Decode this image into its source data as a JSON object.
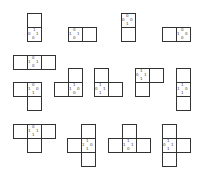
{
  "diagram": {
    "title": "",
    "cell_size": 14,
    "line_color": "#333333",
    "shapes": [
      {
        "id": "s1",
        "cells": [
          [
            27,
            13
          ],
          [
            27,
            27
          ]
        ],
        "marked": [
          27,
          27
        ],
        "marks": [
          {
            "t": "1",
            "dx": 6,
            "dy": 1
          },
          {
            "t": "0",
            "dx": 1,
            "dy": 5
          },
          {
            "t": "1",
            "dx": 9,
            "dy": 5
          },
          {
            "t": "0",
            "dx": 5,
            "dy": 9
          }
        ]
      },
      {
        "id": "s2",
        "cells": [
          [
            68,
            27
          ],
          [
            82,
            27
          ]
        ],
        "marked": [
          68,
          27
        ],
        "marks": [
          {
            "t": "0",
            "dx": 5,
            "dy": 1
          },
          {
            "t": "1",
            "dx": 1,
            "dy": 5
          },
          {
            "t": "1",
            "dx": 9,
            "dy": 5
          },
          {
            "t": "0",
            "dx": 5,
            "dy": 9
          }
        ]
      },
      {
        "id": "s3",
        "cells": [
          [
            121,
            13
          ],
          [
            121,
            27
          ]
        ],
        "marked": [
          121,
          13
        ],
        "marks": [
          {
            "t": "0",
            "dx": 5,
            "dy": 1
          },
          {
            "t": "0",
            "dx": 1,
            "dy": 5
          },
          {
            "t": "0",
            "dx": 9,
            "dy": 5
          },
          {
            "t": "1",
            "dx": 5,
            "dy": 9
          }
        ]
      },
      {
        "id": "s4",
        "cells": [
          [
            162,
            27
          ],
          [
            176,
            27
          ]
        ],
        "marked": [
          176,
          27
        ],
        "marks": [
          {
            "t": "0",
            "dx": 5,
            "dy": 1
          },
          {
            "t": "1",
            "dx": 1,
            "dy": 5
          },
          {
            "t": "0",
            "dx": 9,
            "dy": 5
          },
          {
            "t": "0",
            "dx": 5,
            "dy": 9
          }
        ]
      },
      {
        "id": "s5",
        "cells": [
          [
            13,
            55
          ],
          [
            27,
            55
          ],
          [
            41,
            55
          ]
        ],
        "marked": [
          27,
          55
        ],
        "marks": [
          {
            "t": "0",
            "dx": 5,
            "dy": 1
          },
          {
            "t": "1",
            "dx": 1,
            "dy": 5
          },
          {
            "t": "1",
            "dx": 9,
            "dy": 5
          },
          {
            "t": "0",
            "dx": 5,
            "dy": 9
          }
        ]
      },
      {
        "id": "s6",
        "cells": [
          [
            13,
            82
          ],
          [
            27,
            82
          ],
          [
            27,
            96
          ]
        ],
        "marked": [
          27,
          82
        ],
        "marks": [
          {
            "t": "0",
            "dx": 5,
            "dy": 1
          },
          {
            "t": "1",
            "dx": 1,
            "dy": 5
          },
          {
            "t": "0",
            "dx": 9,
            "dy": 5
          },
          {
            "t": "1",
            "dx": 5,
            "dy": 9
          }
        ]
      },
      {
        "id": "s7",
        "cells": [
          [
            68,
            68
          ],
          [
            54,
            82
          ],
          [
            68,
            82
          ]
        ],
        "marked": [
          68,
          82
        ],
        "marks": [
          {
            "t": "1",
            "dx": 5,
            "dy": 1
          },
          {
            "t": "1",
            "dx": 1,
            "dy": 5
          },
          {
            "t": "0",
            "dx": 9,
            "dy": 5
          },
          {
            "t": "0",
            "dx": 5,
            "dy": 9
          }
        ]
      },
      {
        "id": "s8",
        "cells": [
          [
            94,
            68
          ],
          [
            94,
            82
          ],
          [
            108,
            82
          ]
        ],
        "marked": [
          94,
          82
        ],
        "marks": [
          {
            "t": "1",
            "dx": 5,
            "dy": 1
          },
          {
            "t": "0",
            "dx": 1,
            "dy": 5
          },
          {
            "t": "1",
            "dx": 9,
            "dy": 5
          },
          {
            "t": "1",
            "dx": 5,
            "dy": 9
          }
        ]
      },
      {
        "id": "s9",
        "cells": [
          [
            135,
            68
          ],
          [
            149,
            68
          ],
          [
            135,
            82
          ]
        ],
        "marked": [
          135,
          68
        ],
        "marks": [
          {
            "t": "1",
            "dx": 5,
            "dy": 1
          },
          {
            "t": "0",
            "dx": 1,
            "dy": 5
          },
          {
            "t": "1",
            "dx": 9,
            "dy": 5
          },
          {
            "t": "1",
            "dx": 5,
            "dy": 9
          }
        ]
      },
      {
        "id": "s10",
        "cells": [
          [
            176,
            68
          ],
          [
            176,
            82
          ],
          [
            176,
            96
          ]
        ],
        "marked": [
          176,
          82
        ],
        "marks": [
          {
            "t": "1",
            "dx": 5,
            "dy": 1
          },
          {
            "t": "1",
            "dx": 1,
            "dy": 5
          },
          {
            "t": "0",
            "dx": 9,
            "dy": 5
          },
          {
            "t": "1",
            "dx": 5,
            "dy": 9
          }
        ]
      },
      {
        "id": "s11",
        "cells": [
          [
            13,
            124
          ],
          [
            27,
            124
          ],
          [
            41,
            124
          ],
          [
            27,
            138
          ]
        ],
        "marked": [
          27,
          124
        ],
        "marks": [
          {
            "t": "0",
            "dx": 5,
            "dy": 1
          },
          {
            "t": "1",
            "dx": 1,
            "dy": 5
          },
          {
            "t": "1",
            "dx": 9,
            "dy": 5
          },
          {
            "t": "1",
            "dx": 5,
            "dy": 9
          }
        ]
      },
      {
        "id": "s12",
        "cells": [
          [
            81,
            124
          ],
          [
            67,
            138
          ],
          [
            81,
            138
          ],
          [
            81,
            152
          ]
        ],
        "marked": [
          81,
          138
        ],
        "marks": [
          {
            "t": "1",
            "dx": 5,
            "dy": 1
          },
          {
            "t": "1",
            "dx": 1,
            "dy": 5
          },
          {
            "t": "0",
            "dx": 9,
            "dy": 5
          },
          {
            "t": "1",
            "dx": 5,
            "dy": 9
          }
        ]
      },
      {
        "id": "s13",
        "cells": [
          [
            122,
            124
          ],
          [
            108,
            138
          ],
          [
            122,
            138
          ],
          [
            136,
            138
          ]
        ],
        "marked": [
          122,
          138
        ],
        "marks": [
          {
            "t": "1",
            "dx": 5,
            "dy": 1
          },
          {
            "t": "1",
            "dx": 1,
            "dy": 5
          },
          {
            "t": "1",
            "dx": 9,
            "dy": 5
          },
          {
            "t": "0",
            "dx": 5,
            "dy": 9
          }
        ]
      },
      {
        "id": "s14",
        "cells": [
          [
            162,
            124
          ],
          [
            162,
            138
          ],
          [
            176,
            138
          ],
          [
            162,
            152
          ]
        ],
        "marked": [
          162,
          138
        ],
        "marks": [
          {
            "t": "1",
            "dx": 5,
            "dy": 1
          },
          {
            "t": "0",
            "dx": 1,
            "dy": 5
          },
          {
            "t": "1",
            "dx": 9,
            "dy": 5
          },
          {
            "t": "1",
            "dx": 5,
            "dy": 9
          }
        ]
      }
    ]
  }
}
